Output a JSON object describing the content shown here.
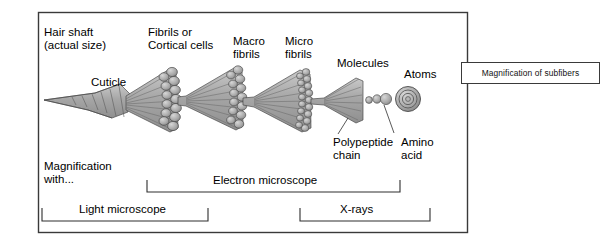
{
  "diagram": {
    "title_labels": {
      "hair_shaft": "Hair shaft\n(actual size)",
      "cuticle": "Cuticle",
      "fibrils": "Fibrils or\nCortical cells",
      "macro_fibrils": "Macro\nfibrils",
      "micro_fibrils": "Micro\nfibrils",
      "molecules": "Molecules",
      "atoms": "Atoms",
      "polypeptide_chain": "Polypeptide\nchain",
      "amino_acid": "Amino\nacid"
    },
    "scale_labels": {
      "magnification_with": "Magnification\nwith...",
      "light_microscope": "Light microscope",
      "electron_microscope": "Electron microscope",
      "xrays": "X-rays"
    },
    "caption": "Magnification of subfibers",
    "colors": {
      "fill_gray": "#a9a9a9",
      "fill_light": "#c3c3c3",
      "outline": "#4a4a4a",
      "frame": "#3a3a3a",
      "text": "#000000",
      "background": "#ffffff"
    }
  }
}
